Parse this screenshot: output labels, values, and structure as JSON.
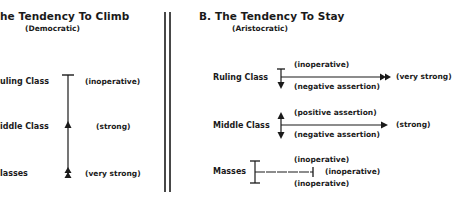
{
  "panel_a": {
    "title": "he Tendency To Climb",
    "subtitle": "(Democratic)",
    "rows": [
      {
        "label": "Ruling Class",
        "note": "(inoperative)"
      },
      {
        "label": "Middle Class",
        "note": "(strong)"
      },
      {
        "label": "Masses",
        "note": "(very strong)"
      }
    ],
    "row_label_prefixes": [
      "uling Class",
      "iddle Class",
      "lasses"
    ]
  },
  "panel_b": {
    "title": "B. The Tendency To Stay",
    "subtitle": "(Aristocratic)",
    "rows": [
      {
        "label": "Ruling Class",
        "above": "(inoperative)",
        "below": "(negative assertion)",
        "right": "(very strong)"
      },
      {
        "label": "Middle Class",
        "above": "(positive assertion)",
        "below": "(negative assertion)",
        "right": "(strong)"
      },
      {
        "label": "Masses",
        "above": "(inoperative)",
        "below": "(inoperative)",
        "right": "(inoperative)"
      }
    ]
  },
  "colors": {
    "ink": "#1a1a1a",
    "background": "#ffffff"
  }
}
